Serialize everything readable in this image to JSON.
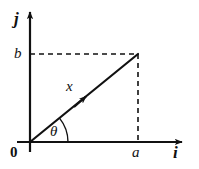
{
  "figure": {
    "type": "vector-diagram",
    "background_color": "#ffffff",
    "ink_color": "#111111",
    "labels": {
      "y_axis_unit_vector": "j",
      "x_axis_unit_vector": "i",
      "origin": "0",
      "y_component": "b",
      "x_component": "a",
      "vector": "x",
      "angle": "θ"
    },
    "geometry": {
      "origin": {
        "x": 30,
        "y": 142
      },
      "tip": {
        "x": 138,
        "y": 54
      },
      "y_axis_arrow_tip": {
        "x": 30,
        "y": 8
      },
      "x_axis_arrow_tip": {
        "x": 186,
        "y": 142
      },
      "x_axis_left_end": {
        "x": 17,
        "y": 142
      },
      "y_axis_bottom_end": {
        "x": 30,
        "y": 152
      },
      "vector_arrow_mid": {
        "x": 88,
        "y": 94
      },
      "angle_arc_radius": 38,
      "angle_degrees": 39,
      "dashed_horizontal": {
        "x1": 30,
        "y1": 54,
        "x2": 138,
        "y2": 54
      },
      "dashed_vertical": {
        "x1": 138,
        "y1": 54,
        "x2": 138,
        "y2": 142
      }
    },
    "styles": {
      "axis_stroke_width": 2.2,
      "vector_stroke_width": 2.2,
      "dash_stroke_width": 1.6,
      "dash_pattern": "5,4",
      "arc_stroke_width": 1.4
    }
  }
}
